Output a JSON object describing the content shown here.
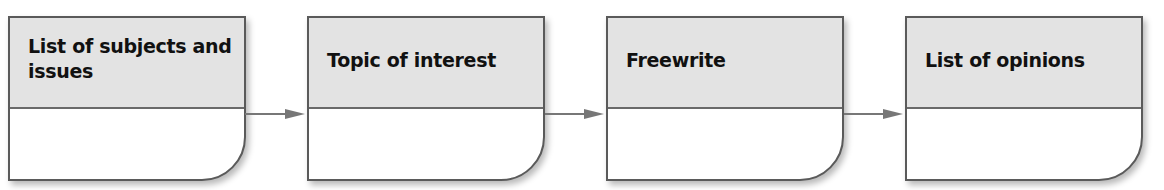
{
  "diagram": {
    "type": "flowchart",
    "direction": "left-to-right",
    "colors": {
      "header_fill": "#e3e3e3",
      "body_fill": "#ffffff",
      "border": "#5a5a5a",
      "arrow": "#777777",
      "text": "#111111"
    },
    "steps": [
      {
        "label": "List of subjects and issues"
      },
      {
        "label": "Topic of interest"
      },
      {
        "label": "Freewrite"
      },
      {
        "label": "List of opinions"
      }
    ],
    "connectors": [
      {
        "from": 0,
        "to": 1
      },
      {
        "from": 1,
        "to": 2
      },
      {
        "from": 2,
        "to": 3
      }
    ]
  }
}
